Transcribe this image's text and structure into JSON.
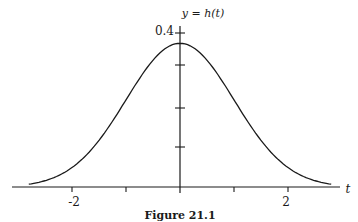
{
  "chart_data": {
    "type": "line",
    "title": "",
    "caption": "Figure 21.1",
    "curve_label": "y = h(t)",
    "xlabel": "t",
    "ylabel": "",
    "xlim": [
      -2.85,
      2.85
    ],
    "ylim": [
      0,
      0.4
    ],
    "x_ticks": [
      -2,
      -1,
      0,
      1,
      2
    ],
    "x_tick_labels": [
      "-2",
      "2"
    ],
    "y_ticks": [
      0.1,
      0.2,
      0.3,
      0.4
    ],
    "y_tick_labels": [
      "0.4"
    ],
    "grid": false,
    "legend": null,
    "series": [
      {
        "name": "h(t)",
        "description": "standard normal density, peak ≈ 0.4 at t = 0",
        "x": [
          -2.8,
          -2.5,
          -2.0,
          -1.5,
          -1.0,
          -0.5,
          0,
          0.5,
          1.0,
          1.5,
          2.0,
          2.5,
          2.8
        ],
        "y": [
          0.008,
          0.018,
          0.054,
          0.13,
          0.242,
          0.352,
          0.399,
          0.352,
          0.242,
          0.13,
          0.054,
          0.018,
          0.008
        ]
      }
    ]
  },
  "labels": {
    "curve": "y = h(t)",
    "y_top": "0.4",
    "x_neg2": "-2",
    "x_pos2": "2",
    "x_axis": "t",
    "caption": "Figure 21.1"
  }
}
